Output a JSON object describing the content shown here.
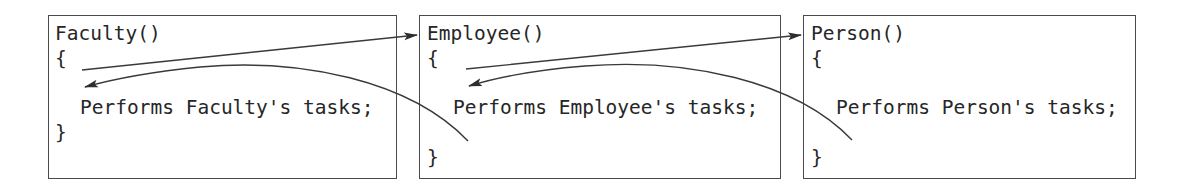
{
  "diagram": {
    "colors": {
      "stroke": "#3a3a3a",
      "border": "#4a4a4a",
      "text": "#262626",
      "background": "#ffffff"
    },
    "boxes": [
      {
        "id": "faculty",
        "header": "Faculty()",
        "open_brace": "{",
        "body": "Performs Faculty's tasks;",
        "close_brace": "}"
      },
      {
        "id": "employee",
        "header": "Employee()",
        "open_brace": "{",
        "body": "Performs Employee's tasks;",
        "close_brace": "}"
      },
      {
        "id": "person",
        "header": "Person()",
        "open_brace": "{",
        "body": "Performs Person's tasks;",
        "close_brace": "}"
      }
    ],
    "arrows": [
      {
        "from": "faculty",
        "to": "employee",
        "kind": "call"
      },
      {
        "from": "employee",
        "to": "faculty",
        "kind": "return"
      },
      {
        "from": "employee",
        "to": "person",
        "kind": "call"
      },
      {
        "from": "person",
        "to": "employee",
        "kind": "return"
      }
    ]
  }
}
